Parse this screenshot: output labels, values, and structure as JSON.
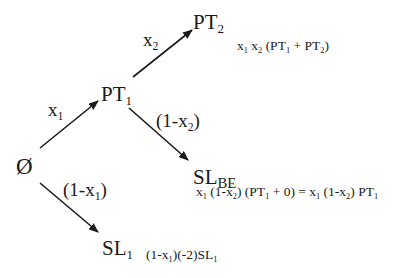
{
  "diagram": {
    "type": "decision-tree",
    "stroke_color": "#1a1a1a",
    "background": "#ffffff",
    "nodes": {
      "root": {
        "label": "Ø"
      },
      "pt1": {
        "base": "PT",
        "sub": "1"
      },
      "pt2": {
        "base": "PT",
        "sub": "2"
      },
      "slbe": {
        "base": "SL",
        "sub": "BE"
      },
      "sl1": {
        "base": "SL",
        "sub": "1"
      }
    },
    "edges": [
      {
        "from": "root",
        "to": "pt1",
        "label_base": "x",
        "label_sub": "1"
      },
      {
        "from": "pt1",
        "to": "pt2",
        "label_base": "x",
        "label_sub": "2"
      },
      {
        "from": "pt1",
        "to": "slbe",
        "label_pre": "(1-x",
        "label_sub": "2",
        "label_post": ")"
      },
      {
        "from": "root",
        "to": "sl1",
        "label_pre": "(1-x",
        "label_sub": "1",
        "label_post": ")"
      }
    ],
    "payoffs": {
      "pt2": {
        "parts": [
          "x",
          "1",
          " x",
          "2",
          " (PT",
          "1",
          " + PT",
          "2",
          ")"
        ]
      },
      "slbe": {
        "parts": [
          "x",
          "1",
          " (1-x",
          "2",
          ") (PT",
          "1",
          " + 0) = x",
          "1",
          " (1-x",
          "2",
          ") PT",
          "1",
          ""
        ]
      },
      "sl1": {
        "parts": [
          "(1-x",
          "1",
          ")(-2)SL",
          "1",
          ""
        ]
      }
    }
  }
}
